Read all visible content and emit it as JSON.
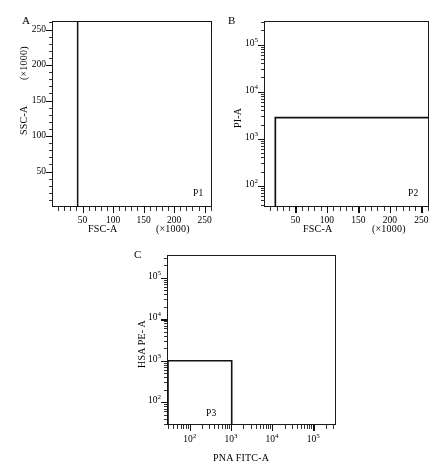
{
  "figure": {
    "background": "#ffffff",
    "ink": "#111111"
  },
  "panels": [
    {
      "id": "A",
      "letter": "A",
      "xaxis": {
        "label": "FSC-A",
        "unit": "(×1000)",
        "scale": "linear",
        "min": 0,
        "max": 262,
        "ticks": [
          50,
          100,
          150,
          200,
          250
        ],
        "tick_labels": [
          "50",
          "100",
          "150",
          "200",
          "250"
        ],
        "minor_tick_step": 10
      },
      "yaxis": {
        "label": "SSC-A",
        "unit": "(×1000)",
        "scale": "linear",
        "min": 0,
        "max": 262,
        "ticks": [
          50,
          100,
          150,
          200,
          250
        ],
        "tick_labels": [
          "50",
          "100",
          "150",
          "200",
          "250"
        ],
        "minor_tick_step": 10
      },
      "gate": {
        "name": "P1",
        "type": "polygon",
        "points": [
          [
            42,
            0
          ],
          [
            42,
            262
          ],
          [
            262,
            262
          ],
          [
            262,
            248
          ]
        ]
      },
      "populations": [
        {
          "name": "main-dense-blob",
          "n": 14000,
          "cx": 78,
          "cy": 150,
          "sx": 26,
          "sy": 62,
          "rho": 0.55,
          "gray": 10
        },
        {
          "name": "left-edge-column",
          "n": 5200,
          "cx": 52,
          "cy": 140,
          "sx": 7,
          "sy": 70,
          "rho": 0.2,
          "gray": 10
        },
        {
          "name": "diagonal-spread",
          "n": 4200,
          "cx": 120,
          "cy": 180,
          "sx": 34,
          "sy": 45,
          "rho": 0.78,
          "gray": 55
        },
        {
          "name": "debris-low-ssc",
          "n": 620,
          "cx": 105,
          "cy": 16,
          "sx": 18,
          "sy": 6,
          "rho": 0.1,
          "gray": 110
        },
        {
          "name": "sparse-right-tail",
          "n": 420,
          "cx": 190,
          "cy": 90,
          "sx": 40,
          "sy": 60,
          "rho": 0.3,
          "gray": 160
        }
      ]
    },
    {
      "id": "B",
      "letter": "B",
      "xaxis": {
        "label": "FSC-A",
        "unit": "(×1000)",
        "scale": "linear",
        "min": 0,
        "max": 262,
        "ticks": [
          50,
          100,
          150,
          200,
          250
        ],
        "tick_labels": [
          "50",
          "100",
          "150",
          "200",
          "250"
        ],
        "minor_tick_step": 10
      },
      "yaxis": {
        "label": "PI-A",
        "unit": "",
        "scale": "log",
        "min_exp": 1.55,
        "max_exp": 5.5,
        "ticks": [
          2,
          3,
          4,
          5
        ],
        "tick_labels": [
          "10²",
          "10³",
          "10⁴",
          "10⁵"
        ]
      },
      "gate": {
        "name": "P2",
        "type": "rect",
        "x0": 18,
        "x1": 262,
        "y0_exp": 1.55,
        "y1_exp": 3.45
      },
      "populations": [
        {
          "name": "pi-negative-cluster",
          "n": 2100,
          "cx": 100,
          "cy_exp": 2.45,
          "sx": 16,
          "sy_exp": 0.3,
          "rho": 0.15,
          "gray": 40
        },
        {
          "name": "pi-negative-halo",
          "n": 1500,
          "cx": 118,
          "cy_exp": 2.75,
          "sx": 34,
          "sy_exp": 0.42,
          "rho": 0.2,
          "gray": 140
        },
        {
          "name": "pi-positive-band",
          "n": 220,
          "cx": 140,
          "cy_exp": 4.05,
          "sx": 55,
          "sy_exp": 0.33,
          "rho": 0.0,
          "gray": 90
        },
        {
          "name": "pi-positive-cluster",
          "n": 95,
          "cx": 72,
          "cy_exp": 4.12,
          "sx": 10,
          "sy_exp": 0.13,
          "rho": 0.0,
          "gray": 60
        },
        {
          "name": "upper-scatter",
          "n": 70,
          "cx": 150,
          "cy_exp": 4.85,
          "sx": 62,
          "sy_exp": 0.38,
          "rho": 0.0,
          "gray": 150
        }
      ]
    },
    {
      "id": "C",
      "letter": "C",
      "xaxis": {
        "label": "PNA FITC-A",
        "unit": "",
        "scale": "log",
        "min_exp": 1.45,
        "max_exp": 5.55,
        "ticks": [
          2,
          3,
          4,
          5
        ],
        "tick_labels": [
          "10²",
          "10³",
          "10⁴",
          "10⁵"
        ]
      },
      "yaxis": {
        "label": "HSA PE- A",
        "unit": "",
        "scale": "log",
        "min_exp": 1.45,
        "max_exp": 5.55,
        "ticks": [
          2,
          3,
          4,
          5
        ],
        "tick_labels": [
          "10²",
          "10³",
          "10⁴",
          "10⁵"
        ]
      },
      "gate": {
        "name": "P3",
        "type": "rect",
        "x0_exp": 1.45,
        "x1_exp": 3.02,
        "y0_exp": 1.45,
        "y1_exp": 3.0
      },
      "populations": [
        {
          "name": "double-positive-cluster",
          "n": 2300,
          "cx_exp": 4.62,
          "cy_exp": 3.95,
          "sx_exp": 0.3,
          "sy_exp": 0.26,
          "rho": 0.35,
          "gray": 120
        },
        {
          "name": "diagonal-bridge",
          "n": 1300,
          "cx_exp": 4.05,
          "cy_exp": 3.55,
          "sx_exp": 0.42,
          "sy_exp": 0.36,
          "rho": 0.7,
          "gray": 165
        },
        {
          "name": "upper-diffuse",
          "n": 700,
          "cx_exp": 4.35,
          "cy_exp": 4.75,
          "sx_exp": 0.55,
          "sy_exp": 0.3,
          "rho": 0.2,
          "gray": 190
        },
        {
          "name": "p3-double-negative",
          "n": 520,
          "cx_exp": 2.45,
          "cy_exp": 2.4,
          "sx_exp": 0.3,
          "sy_exp": 0.34,
          "rho": 0.25,
          "gray": 70
        },
        {
          "name": "background-haze",
          "n": 900,
          "cx_exp": 3.9,
          "cy_exp": 3.8,
          "sx_exp": 0.85,
          "sy_exp": 0.8,
          "rho": 0.45,
          "gray": 205
        }
      ]
    }
  ]
}
